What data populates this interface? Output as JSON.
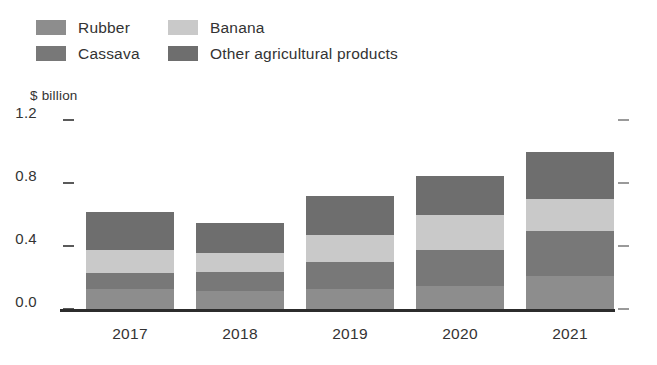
{
  "legend": {
    "rows": [
      [
        {
          "label": "Rubber",
          "color": "#8d8d8d",
          "name": "legend-item-rubber"
        },
        {
          "label": "Banana",
          "color": "#c9c9c9",
          "name": "legend-item-banana"
        }
      ],
      [
        {
          "label": "Cassava",
          "color": "#787878",
          "name": "legend-item-cassava"
        },
        {
          "label": "Other agricultural products",
          "color": "#6e6e6e",
          "name": "legend-item-other"
        }
      ]
    ]
  },
  "chart_data": {
    "type": "bar",
    "stacked": true,
    "title": "",
    "subtitle": "",
    "xlabel": "",
    "ylabel": "$ billion",
    "ylim": [
      0.0,
      1.2
    ],
    "yticks": [
      "0.0",
      "0.4",
      "0.8",
      "1.2"
    ],
    "ytick_values": [
      0.0,
      0.4,
      0.8,
      1.2
    ],
    "grid": false,
    "legend_position": "top-left",
    "categories": [
      "2017",
      "2018",
      "2019",
      "2020",
      "2021"
    ],
    "series": [
      {
        "name": "Rubber",
        "color": "#8d8d8d",
        "values": [
          0.13,
          0.12,
          0.13,
          0.15,
          0.21
        ]
      },
      {
        "name": "Cassava",
        "color": "#787878",
        "values": [
          0.1,
          0.12,
          0.17,
          0.23,
          0.29
        ]
      },
      {
        "name": "Banana",
        "color": "#c9c9c9",
        "values": [
          0.15,
          0.12,
          0.17,
          0.22,
          0.2
        ]
      },
      {
        "name": "Other agricultural products",
        "color": "#6e6e6e",
        "values": [
          0.24,
          0.19,
          0.25,
          0.25,
          0.3
        ]
      }
    ],
    "totals": [
      0.62,
      0.55,
      0.72,
      0.85,
      1.0
    ]
  },
  "axis": {
    "unit_label": "$ billion"
  }
}
